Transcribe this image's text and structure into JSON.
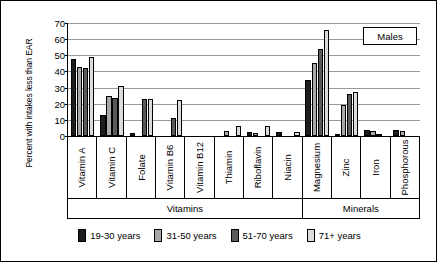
{
  "chart_data": {
    "type": "bar",
    "title": "",
    "annotation": "Males",
    "xlabel": "",
    "ylabel": "Percent with intakes less than EAR",
    "ylim": [
      0,
      70
    ],
    "yticks": [
      0,
      10,
      20,
      30,
      40,
      50,
      60,
      70
    ],
    "grid": true,
    "legend_position": "bottom",
    "categories": [
      "Vitamin A",
      "Vitamin C",
      "Folate",
      "Vitamin B6",
      "Vitamin B12",
      "Thiamin",
      "Riboflavin",
      "Niacin",
      "Magnesium",
      "Zinc",
      "Iron",
      "Phosphorous"
    ],
    "category_groups": [
      {
        "label": "Vitamins",
        "count": 8
      },
      {
        "label": "Minerals",
        "count": 4
      }
    ],
    "series": [
      {
        "name": "19-30 years",
        "color": "#1d1d1d",
        "values": [
          48,
          13,
          2,
          0,
          0,
          0,
          2.5,
          2.5,
          35,
          1,
          3.5,
          3.5
        ]
      },
      {
        "name": "31-50 years",
        "color": "#a8a8a8",
        "values": [
          43,
          24.5,
          0,
          0,
          0,
          3,
          2,
          0,
          45.5,
          19,
          3,
          3
        ]
      },
      {
        "name": "51-70 years",
        "color": "#5a5a5a",
        "values": [
          42,
          23.5,
          23,
          11,
          0,
          0,
          0,
          0,
          54,
          26,
          0.5,
          0
        ]
      },
      {
        "name": "71+ years",
        "color": "#dcdcdc",
        "values": [
          49,
          31,
          23,
          22.5,
          0,
          6,
          6,
          2.5,
          65.5,
          27,
          0,
          0
        ]
      }
    ]
  }
}
